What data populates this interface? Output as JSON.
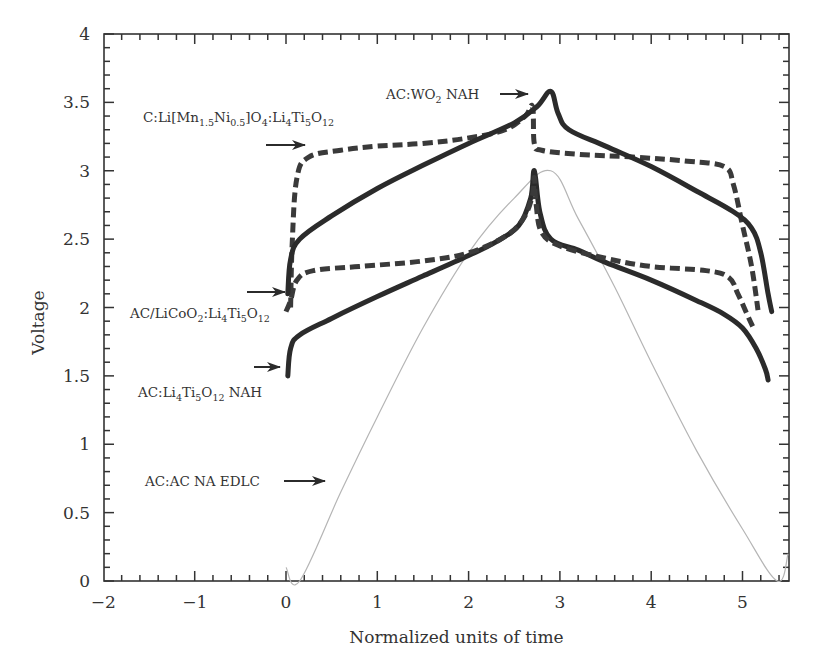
{
  "chart_data": {
    "type": "line",
    "title": "",
    "xlabel": "Normalized units of time",
    "ylabel": "Voltage",
    "xlim": [
      -2,
      5.5
    ],
    "ylim": [
      0,
      4
    ],
    "x_ticks": [
      -2,
      -1,
      0,
      1,
      2,
      3,
      4,
      5
    ],
    "x_tick_labels": [
      "−2",
      "−1",
      "0",
      "1",
      "2",
      "3",
      "4",
      "5"
    ],
    "y_ticks": [
      0,
      0.5,
      1,
      1.5,
      2,
      2.5,
      3,
      3.5,
      4
    ],
    "y_tick_labels": [
      "0",
      "0.5",
      "1",
      "1.5",
      "2",
      "2.5",
      "3",
      "3.5",
      "4"
    ],
    "x_minor_step": 0.2,
    "y_minor_step": 0.1,
    "grid": false,
    "legend": "none (arrow annotations)",
    "series": [
      {
        "name": "AC:WO2 NAH",
        "style": "solid-thick",
        "color": "#2b2b2b",
        "points": [
          [
            0.02,
            2.1
          ],
          [
            0.05,
            2.35
          ],
          [
            0.15,
            2.5
          ],
          [
            0.5,
            2.67
          ],
          [
            1.0,
            2.87
          ],
          [
            1.5,
            3.04
          ],
          [
            2.0,
            3.2
          ],
          [
            2.5,
            3.35
          ],
          [
            2.75,
            3.47
          ],
          [
            2.9,
            3.58
          ],
          [
            2.98,
            3.42
          ],
          [
            3.1,
            3.3
          ],
          [
            3.5,
            3.18
          ],
          [
            4.0,
            3.03
          ],
          [
            4.5,
            2.85
          ],
          [
            4.9,
            2.7
          ],
          [
            5.1,
            2.58
          ],
          [
            5.2,
            2.4
          ],
          [
            5.28,
            2.1
          ],
          [
            5.32,
            1.97
          ]
        ]
      },
      {
        "name": "C:Li[Mn1.5Ni0.5]O4:Li4Ti5O12",
        "style": "dashed-thick",
        "color": "#3a3a3a",
        "points": [
          [
            0.05,
            2.0
          ],
          [
            0.07,
            2.5
          ],
          [
            0.12,
            2.95
          ],
          [
            0.25,
            3.1
          ],
          [
            0.6,
            3.15
          ],
          [
            1.0,
            3.18
          ],
          [
            1.5,
            3.2
          ],
          [
            2.0,
            3.24
          ],
          [
            2.4,
            3.3
          ],
          [
            2.62,
            3.4
          ],
          [
            2.7,
            3.47
          ],
          [
            2.72,
            3.2
          ],
          [
            2.8,
            3.15
          ],
          [
            3.2,
            3.12
          ],
          [
            3.8,
            3.1
          ],
          [
            4.4,
            3.07
          ],
          [
            4.8,
            3.03
          ],
          [
            4.9,
            2.9
          ],
          [
            5.0,
            2.6
          ],
          [
            5.1,
            2.3
          ],
          [
            5.17,
            1.98
          ]
        ]
      },
      {
        "name": "AC/LiCoO2:Li4Ti5O12",
        "style": "dashed-thick",
        "color": "#3a3a3a",
        "points": [
          [
            0.0,
            1.97
          ],
          [
            0.05,
            2.05
          ],
          [
            0.12,
            2.2
          ],
          [
            0.3,
            2.27
          ],
          [
            0.8,
            2.3
          ],
          [
            1.5,
            2.34
          ],
          [
            2.0,
            2.4
          ],
          [
            2.4,
            2.52
          ],
          [
            2.6,
            2.65
          ],
          [
            2.7,
            2.82
          ],
          [
            2.72,
            2.95
          ],
          [
            2.74,
            2.75
          ],
          [
            2.8,
            2.55
          ],
          [
            3.0,
            2.45
          ],
          [
            3.5,
            2.36
          ],
          [
            4.0,
            2.3
          ],
          [
            4.6,
            2.27
          ],
          [
            4.85,
            2.22
          ],
          [
            4.95,
            2.1
          ],
          [
            5.05,
            1.95
          ],
          [
            5.12,
            1.85
          ]
        ]
      },
      {
        "name": "AC:Li4Ti5O12 NAH",
        "style": "solid-thick",
        "color": "#2b2b2b",
        "points": [
          [
            0.02,
            1.5
          ],
          [
            0.05,
            1.7
          ],
          [
            0.15,
            1.8
          ],
          [
            0.5,
            1.92
          ],
          [
            1.0,
            2.08
          ],
          [
            1.5,
            2.23
          ],
          [
            2.0,
            2.38
          ],
          [
            2.3,
            2.48
          ],
          [
            2.55,
            2.6
          ],
          [
            2.68,
            2.8
          ],
          [
            2.72,
            3.0
          ],
          [
            2.78,
            2.7
          ],
          [
            2.9,
            2.5
          ],
          [
            3.2,
            2.42
          ],
          [
            3.5,
            2.33
          ],
          [
            4.0,
            2.2
          ],
          [
            4.5,
            2.05
          ],
          [
            4.8,
            1.95
          ],
          [
            5.0,
            1.85
          ],
          [
            5.15,
            1.7
          ],
          [
            5.25,
            1.55
          ],
          [
            5.28,
            1.47
          ]
        ]
      },
      {
        "name": "AC:AC NA EDLC",
        "style": "solid-thin",
        "color": "#b5b5b5",
        "points": [
          [
            0.0,
            0.1
          ],
          [
            0.15,
            0.0
          ],
          [
            0.6,
            0.65
          ],
          [
            1.0,
            1.2
          ],
          [
            1.5,
            1.85
          ],
          [
            2.0,
            2.4
          ],
          [
            2.5,
            2.8
          ],
          [
            2.9,
            3.0
          ],
          [
            3.2,
            2.65
          ],
          [
            3.6,
            2.15
          ],
          [
            4.0,
            1.6
          ],
          [
            4.5,
            0.95
          ],
          [
            5.0,
            0.38
          ],
          [
            5.38,
            0.0
          ],
          [
            5.5,
            0.2
          ]
        ]
      }
    ],
    "annotations": [
      {
        "label": "AC:WO2 NAH",
        "text_x": 386,
        "text_y": 98,
        "arrow_from": [
          500,
          94
        ],
        "arrow_to": [
          528,
          94
        ]
      },
      {
        "label": "C:Li[Mn1.5Ni0.5]O4:Li4Ti5O12",
        "text_x": 143,
        "text_y": 122,
        "arrow_from": [
          266,
          145
        ],
        "arrow_to": [
          305,
          145
        ]
      },
      {
        "label": "AC/LiCoO2:Li4Ti5O12",
        "text_x": 130,
        "text_y": 318,
        "arrow_from": [
          247,
          292
        ],
        "arrow_to": [
          285,
          292
        ]
      },
      {
        "label": "AC:Li4Ti5O12 NAH",
        "text_x": 138,
        "text_y": 397,
        "arrow_from": [
          254,
          367
        ],
        "arrow_to": [
          280,
          367
        ]
      },
      {
        "label": "AC:AC NA EDLC",
        "text_x": 145,
        "text_y": 485,
        "arrow_from": [
          284,
          481
        ],
        "arrow_to": [
          325,
          481
        ]
      }
    ]
  }
}
